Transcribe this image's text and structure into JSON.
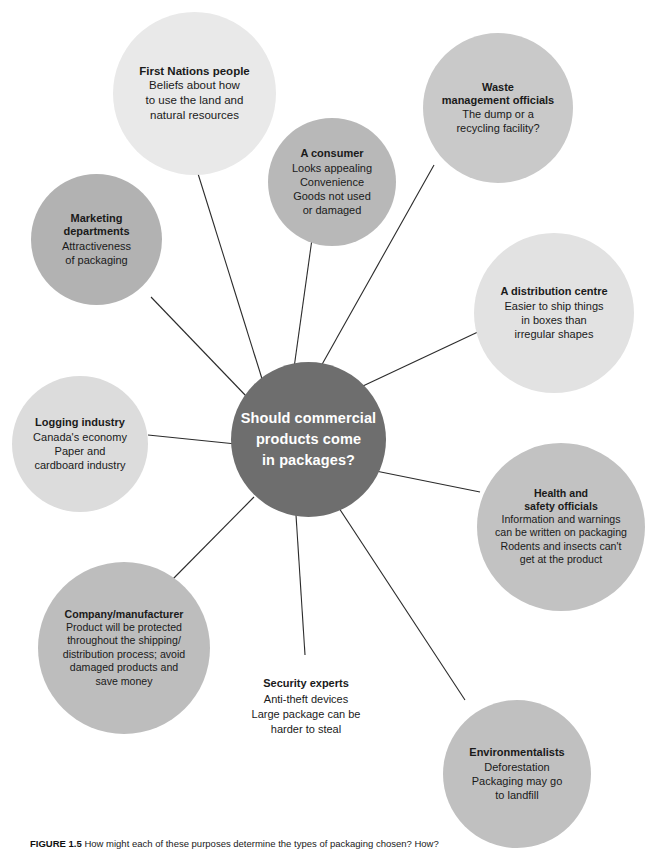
{
  "figure": {
    "center": {
      "lines": [
        "Should commercial",
        "products come",
        "in packages?"
      ],
      "color": "#6e6e6e",
      "text_color": "#ffffff"
    },
    "nodes": [
      {
        "id": "first-nations-people",
        "heading": [
          "First Nations people"
        ],
        "body": [
          "Beliefs about how",
          "to use the land and",
          "natural resources"
        ],
        "color": "#e9e9e9",
        "shape": "circle"
      },
      {
        "id": "waste-management-officials",
        "heading": [
          "Waste",
          "management officials"
        ],
        "body": [
          "The dump or a",
          "recycling facility?"
        ],
        "color": "#c9c9c9",
        "shape": "circle"
      },
      {
        "id": "a-consumer",
        "heading": [
          "A consumer"
        ],
        "body": [
          "Looks appealing",
          "Convenience",
          "Goods not used",
          "or damaged"
        ],
        "color": "#b8b8b8",
        "shape": "circle"
      },
      {
        "id": "marketing-departments",
        "heading": [
          "Marketing",
          "departments"
        ],
        "body": [
          "Attractiveness",
          "of packaging"
        ],
        "color": "#b2b2b2",
        "shape": "circle"
      },
      {
        "id": "a-distribution-centre",
        "heading": [
          "A distribution centre"
        ],
        "body": [
          "Easier to ship things",
          "in boxes than",
          "irregular shapes"
        ],
        "color": "#e2e2e2",
        "shape": "circle"
      },
      {
        "id": "logging-industry",
        "heading": [
          "Logging industry"
        ],
        "body": [
          "Canada's economy",
          "Paper and",
          "cardboard industry"
        ],
        "color": "#dcdcdc",
        "shape": "circle"
      },
      {
        "id": "health-and-safety-officials",
        "heading": [
          "Health and",
          "safety officials"
        ],
        "body": [
          "Information and warnings",
          "can be written on packaging",
          "Rodents and insects can't",
          "get at the product"
        ],
        "color": "#c2c2c2",
        "shape": "circle"
      },
      {
        "id": "company-manufacturer",
        "heading": [
          "Company/manufacturer"
        ],
        "body": [
          "Product will be protected",
          "throughout the shipping/",
          "distribution process; avoid",
          "damaged products and",
          "save money"
        ],
        "color": "#bdbdbd",
        "shape": "circle"
      },
      {
        "id": "security-experts",
        "heading": [
          "Security experts"
        ],
        "body": [
          "Anti-theft devices",
          "Large package can be",
          "harder to steal"
        ],
        "color": "#ffffff",
        "shape": "none"
      },
      {
        "id": "environmentalists",
        "heading": [
          "Environmentalists"
        ],
        "body": [
          "Deforestation",
          "Packaging may go",
          "to landfill"
        ],
        "color": "#c0c0c0",
        "shape": "circle"
      }
    ],
    "caption": {
      "number": "FIGURE 1.5",
      "text": "How might each of these purposes determine the types of packaging chosen? How?"
    }
  }
}
